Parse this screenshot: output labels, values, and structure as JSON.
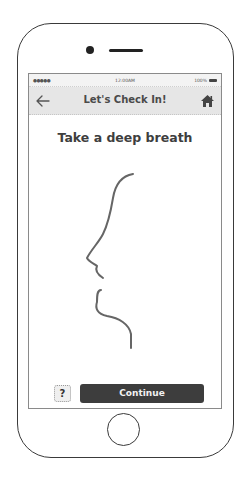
{
  "device": {
    "type": "smartphone-wireframe"
  },
  "status_bar": {
    "signal": "●●●●●",
    "time": "12:00AM",
    "battery": "100%"
  },
  "nav_bar": {
    "back_icon": "arrow-left-icon",
    "title": "Let's Check In!",
    "home_icon": "home-icon"
  },
  "main": {
    "heading": "Take a deep breath",
    "illustration": "face-profile-breathing-sketch"
  },
  "footer": {
    "help_label": "?",
    "continue_label": "Continue"
  },
  "colors": {
    "nav_background": "#e6e6e6",
    "primary_button": "#3d3d3d",
    "text_dark": "#3e3e3e",
    "frame": "#3a3a3a"
  }
}
